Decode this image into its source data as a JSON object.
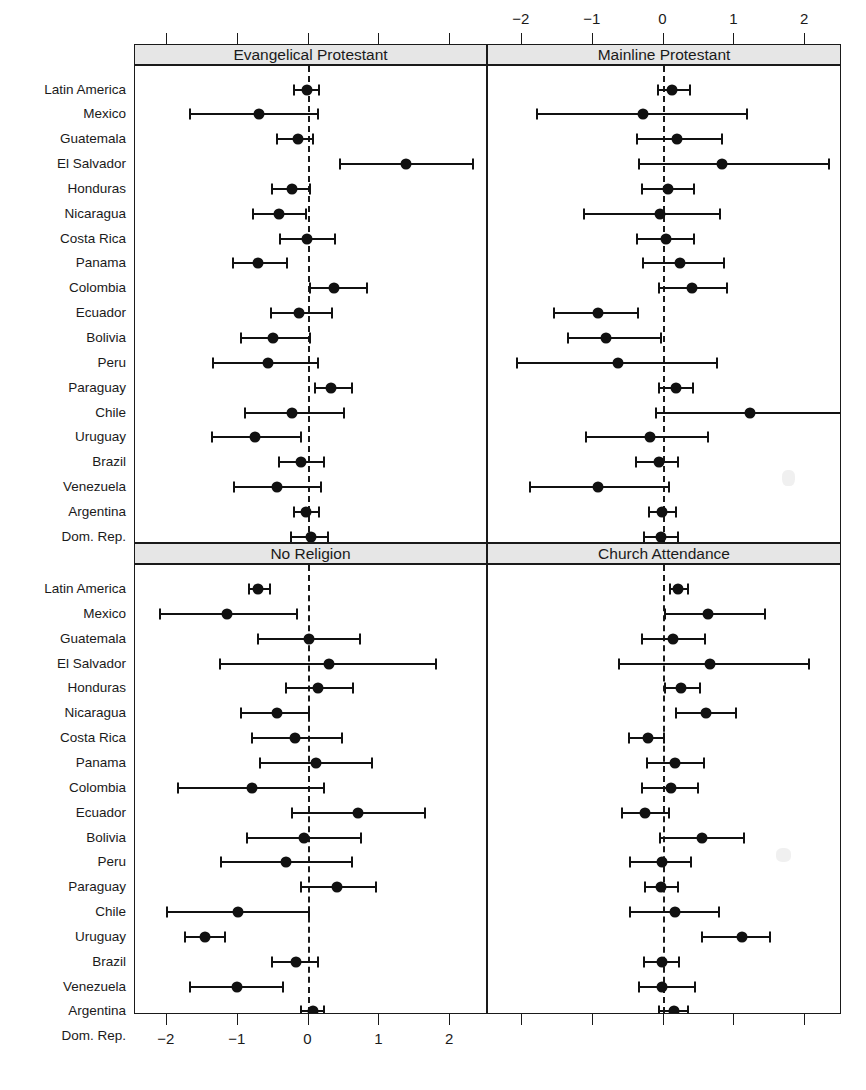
{
  "figure": {
    "type": "coefficient-forest-plot",
    "rows": [
      "Latin America",
      "Mexico",
      "Guatemala",
      "El Salvador",
      "Honduras",
      "Nicaragua",
      "Costa Rica",
      "Panama",
      "Colombia",
      "Ecuador",
      "Bolivia",
      "Peru",
      "Paraguay",
      "Chile",
      "Uruguay",
      "Brazil",
      "Venezuela",
      "Argentina",
      "Dom. Rep."
    ],
    "axis": {
      "ticks": [
        -2,
        -1,
        0,
        1,
        2
      ],
      "tick_labels": [
        "−2",
        "−1",
        "0",
        "1",
        "2"
      ],
      "xlim": [
        -2.8,
        2.5
      ],
      "top_axis": true,
      "bottom_axis": true,
      "reference_line": 0,
      "reference_line_style": "dashed"
    },
    "panels": [
      {
        "title": "Evangelical Protestant",
        "position": "top-left"
      },
      {
        "title": "Mainline Protestant",
        "position": "top-right"
      },
      {
        "title": "No Religion",
        "position": "bottom-left"
      },
      {
        "title": "Church Attendance",
        "position": "bottom-right"
      }
    ]
  },
  "chart_data": {
    "type": "scatter",
    "title": "",
    "xlabel": "",
    "ylabel": "",
    "xlim": [
      -2.8,
      2.5
    ],
    "grid": false,
    "legend": "none",
    "reference_line": 0,
    "categories": [
      "Latin America",
      "Mexico",
      "Guatemala",
      "El Salvador",
      "Honduras",
      "Nicaragua",
      "Costa Rica",
      "Panama",
      "Colombia",
      "Ecuador",
      "Bolivia",
      "Peru",
      "Paraguay",
      "Chile",
      "Uruguay",
      "Brazil",
      "Venezuela",
      "Argentina",
      "Dom. Rep."
    ],
    "panels": [
      {
        "name": "Evangelical Protestant",
        "estimates": [
          -0.02,
          -0.7,
          -0.15,
          1.38,
          -0.23,
          -0.41,
          -0.02,
          -0.72,
          0.36,
          -0.14,
          -0.5,
          -0.57,
          0.32,
          -0.24,
          -0.75,
          -0.11,
          -0.44,
          -0.03,
          0.03
        ],
        "ci_low": [
          -0.2,
          -1.67,
          -0.44,
          0.44,
          -0.52,
          -0.79,
          -0.4,
          -1.07,
          0.02,
          -0.53,
          -0.96,
          -1.35,
          0.09,
          -0.9,
          -1.37,
          -0.42,
          -1.05,
          -0.21,
          -0.25
        ],
        "ci_high": [
          0.15,
          0.14,
          0.06,
          2.32,
          0.02,
          -0.03,
          0.37,
          -0.3,
          0.83,
          0.33,
          0.02,
          0.13,
          0.62,
          0.5,
          -0.11,
          0.22,
          0.17,
          0.15,
          0.28
        ]
      },
      {
        "name": "Mainline Protestant",
        "estimates": [
          0.12,
          -0.29,
          0.19,
          0.82,
          0.07,
          -0.05,
          0.03,
          0.23,
          0.4,
          -0.92,
          -0.81,
          -0.64,
          0.18,
          1.22,
          -0.19,
          -0.06,
          -0.92,
          -0.02,
          -0.04
        ],
        "ci_low": [
          -0.08,
          -1.79,
          -0.37,
          -0.35,
          -0.3,
          -1.12,
          -0.37,
          -0.29,
          -0.07,
          -1.54,
          -1.35,
          -2.07,
          -0.06,
          -0.11,
          -1.09,
          -0.39,
          -1.89,
          -0.21,
          -0.27
        ],
        "ci_high": [
          0.37,
          1.18,
          0.83,
          2.34,
          0.43,
          0.8,
          0.43,
          0.85,
          0.9,
          -0.36,
          -0.03,
          0.75,
          0.42,
          2.52,
          0.63,
          0.2,
          0.08,
          0.17,
          0.2
        ]
      },
      {
        "name": "No Religion",
        "estimates": [
          -0.72,
          -1.15,
          0.01,
          0.29,
          0.13,
          -0.45,
          -0.19,
          0.1,
          -0.8,
          0.7,
          -0.06,
          -0.32,
          0.4,
          -1.0,
          -1.46,
          -0.18,
          -1.01,
          0.06,
          0.03
        ],
        "ci_low": [
          -0.84,
          -2.1,
          -0.71,
          -1.25,
          -0.32,
          -0.95,
          -0.8,
          -0.69,
          -1.84,
          -0.23,
          -0.87,
          -1.23,
          -0.1,
          -2.0,
          -1.75,
          -0.52,
          -1.68,
          -0.11,
          -0.13
        ],
        "ci_high": [
          -0.55,
          -0.16,
          0.73,
          1.8,
          0.63,
          0.0,
          0.48,
          0.9,
          0.22,
          1.64,
          0.74,
          0.62,
          0.95,
          0.0,
          -1.18,
          0.14,
          -0.36,
          0.22,
          0.2
        ]
      },
      {
        "name": "Church Attendance",
        "estimates": [
          0.21,
          0.63,
          0.13,
          0.66,
          0.25,
          0.6,
          -0.22,
          0.16,
          0.1,
          -0.26,
          0.55,
          -0.02,
          -0.04,
          0.16,
          1.11,
          -0.02,
          -0.02,
          0.15,
          0.02
        ],
        "ci_low": [
          0.09,
          0.02,
          -0.3,
          -0.63,
          0.02,
          0.18,
          -0.49,
          -0.23,
          -0.31,
          -0.59,
          -0.05,
          -0.47,
          -0.26,
          -0.47,
          0.55,
          -0.28,
          -0.35,
          -0.06,
          -0.09
        ],
        "ci_high": [
          0.34,
          1.43,
          0.58,
          2.05,
          0.52,
          1.02,
          0.01,
          0.57,
          0.49,
          0.08,
          1.13,
          0.39,
          0.2,
          0.79,
          1.5,
          0.22,
          0.45,
          0.35,
          0.16
        ]
      }
    ]
  }
}
